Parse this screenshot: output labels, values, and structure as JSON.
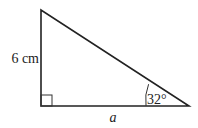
{
  "diagram": {
    "type": "right-triangle",
    "colors": {
      "stroke": "#222222",
      "background": "#ffffff"
    },
    "vertices": {
      "top": [
        41,
        10
      ],
      "right_angle": [
        41,
        106
      ],
      "acute": [
        189,
        106
      ]
    },
    "labels": {
      "vertical_side": "6 cm",
      "base": "a",
      "angle": "32°"
    },
    "right_angle_marker": true
  }
}
